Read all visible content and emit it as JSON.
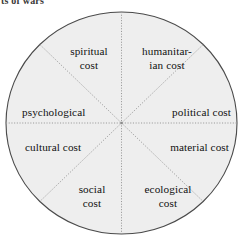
{
  "caption": {
    "text": "ts of wars"
  },
  "diagram": {
    "type": "eight-segment-wheel",
    "fill_color": "#eeeeee",
    "outline_color": "#4a4a4a",
    "divider_color": "#9a9a9a",
    "text_color": "#111111",
    "segment_count": 8,
    "segments": [
      {
        "id": "spiritual",
        "label": "spiritual\ncost",
        "line1": "spiritual",
        "line2": "cost",
        "position": "top-left"
      },
      {
        "id": "humanitarian",
        "label": "humanitar-\nian cost",
        "line1": "humanitar-",
        "line2": "ian cost",
        "position": "top-right"
      },
      {
        "id": "psychological",
        "label": "psychological",
        "line1": "psychological",
        "line2": "",
        "position": "left-upper"
      },
      {
        "id": "political",
        "label": "political cost",
        "line1": "political cost",
        "line2": "",
        "position": "right-upper"
      },
      {
        "id": "cultural",
        "label": "cultural cost",
        "line1": "cultural cost",
        "line2": "",
        "position": "left-lower"
      },
      {
        "id": "material",
        "label": "material cost",
        "line1": "material cost",
        "line2": "",
        "position": "right-lower"
      },
      {
        "id": "social",
        "label": "social\ncost",
        "line1": "social",
        "line2": "cost",
        "position": "bottom-left"
      },
      {
        "id": "ecological",
        "label": "ecological\ncost",
        "line1": "ecological",
        "line2": "cost",
        "position": "bottom-right"
      }
    ]
  }
}
